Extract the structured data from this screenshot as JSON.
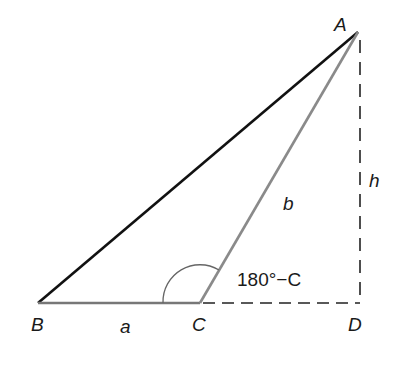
{
  "diagram": {
    "type": "triangle-obtuse-with-altitude",
    "vertices": {
      "A": {
        "label": "A",
        "x": 358,
        "y": 32
      },
      "B": {
        "label": "B",
        "x": 38,
        "y": 303
      },
      "C": {
        "label": "C",
        "x": 200,
        "y": 303
      },
      "D": {
        "label": "D",
        "x": 360,
        "y": 303
      }
    },
    "sides": {
      "a": {
        "label": "a",
        "from": "B",
        "to": "C"
      },
      "b": {
        "label": "b",
        "from": "C",
        "to": "A"
      },
      "c": {
        "from": "B",
        "to": "A"
      }
    },
    "altitude": {
      "label": "h",
      "from": "A",
      "to": "D",
      "style": "dashed"
    },
    "extension": {
      "from": "C",
      "to": "D",
      "style": "dashed"
    },
    "angle_label": "180°−C",
    "colors": {
      "side_c": "#111111",
      "side_a": "#777777",
      "side_b": "#8a8a8a",
      "dashed": "#222222",
      "arc": "#666666"
    }
  }
}
